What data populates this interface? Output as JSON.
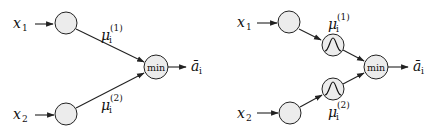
{
  "diagrams": [
    {
      "id": "left",
      "inputs": [
        {
          "symbol": "x",
          "subscript": "1"
        },
        {
          "symbol": "x",
          "subscript": "2"
        }
      ],
      "edge_labels": [
        {
          "symbol": "μ",
          "subscript": "i",
          "superscript": "(1)"
        },
        {
          "symbol": "μ",
          "subscript": "i",
          "superscript": "(2)"
        }
      ],
      "operator": "min",
      "output": {
        "symbol": "ā",
        "subscript": "i"
      }
    },
    {
      "id": "right",
      "inputs": [
        {
          "symbol": "x",
          "subscript": "1"
        },
        {
          "symbol": "x",
          "subscript": "2"
        }
      ],
      "membership_nodes": [
        "gaussian-icon",
        "gaussian-icon"
      ],
      "edge_labels": [
        {
          "symbol": "μ",
          "subscript": "i",
          "superscript": "(1)"
        },
        {
          "symbol": "μ",
          "subscript": "i",
          "superscript": "(2)"
        }
      ],
      "operator": "min",
      "output": {
        "symbol": "ā",
        "subscript": "i"
      }
    }
  ],
  "colors": {
    "node_fill": "#ececec",
    "stroke": "#222222",
    "background": "#ffffff"
  }
}
